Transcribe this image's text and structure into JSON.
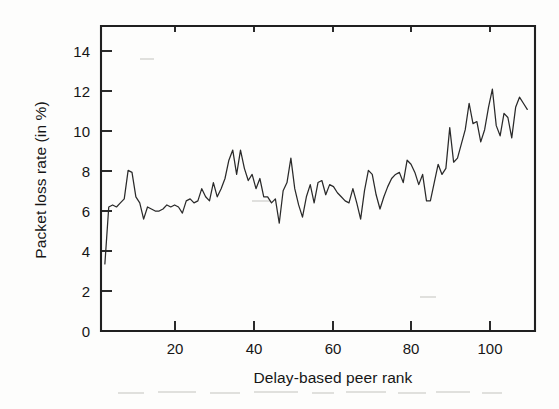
{
  "figure": {
    "background_color": "#fdfdfc",
    "ink_color": "#202020",
    "line_color": "#2a2a2a"
  },
  "chart_data": {
    "type": "line",
    "title": "",
    "xlabel": "Delay-based peer rank",
    "ylabel": "Packet loss rate (in %)",
    "xlim": [
      0,
      112
    ],
    "ylim": [
      0,
      15
    ],
    "xticks": [
      20,
      40,
      60,
      80,
      100
    ],
    "yticks": [
      0,
      2,
      4,
      6,
      8,
      10,
      12,
      14
    ],
    "grid": false,
    "legend": null,
    "series": [
      {
        "name": "Packet loss rate",
        "x": [
          1,
          2,
          3,
          4,
          5,
          6,
          7,
          8,
          9,
          10,
          11,
          12,
          13,
          14,
          15,
          16,
          17,
          18,
          19,
          20,
          21,
          22,
          23,
          24,
          25,
          26,
          27,
          28,
          29,
          30,
          31,
          32,
          33,
          34,
          35,
          36,
          37,
          38,
          39,
          40,
          41,
          42,
          43,
          44,
          45,
          46,
          47,
          48,
          49,
          50,
          51,
          52,
          53,
          54,
          55,
          56,
          57,
          58,
          59,
          60,
          61,
          62,
          63,
          64,
          65,
          66,
          67,
          68,
          69,
          70,
          71,
          72,
          73,
          74,
          75,
          76,
          77,
          78,
          79,
          80,
          81,
          82,
          83,
          84,
          85,
          86,
          87,
          88,
          89,
          90,
          91,
          92,
          93,
          94,
          95,
          96,
          97,
          98,
          99,
          100,
          101,
          102,
          103,
          104,
          105,
          106,
          107,
          108,
          109,
          110
        ],
        "values": [
          3.3,
          6.1,
          6.2,
          6.1,
          6.3,
          6.5,
          7.9,
          7.8,
          6.6,
          6.3,
          5.5,
          6.1,
          6.0,
          5.9,
          5.9,
          6.0,
          6.2,
          6.1,
          6.2,
          6.1,
          5.8,
          6.4,
          6.5,
          6.3,
          6.4,
          7.0,
          6.6,
          6.4,
          7.3,
          6.6,
          7.0,
          7.5,
          8.4,
          8.9,
          7.7,
          8.9,
          8.0,
          7.4,
          7.7,
          7.0,
          7.5,
          6.6,
          6.6,
          6.3,
          6.5,
          5.3,
          6.9,
          7.3,
          8.5,
          7.0,
          6.2,
          5.6,
          6.6,
          7.2,
          6.3,
          7.3,
          7.4,
          6.7,
          7.2,
          7.1,
          6.8,
          6.6,
          6.4,
          6.3,
          7.0,
          6.3,
          5.5,
          6.9,
          7.9,
          7.7,
          6.7,
          6.0,
          6.6,
          7.1,
          7.5,
          7.7,
          7.8,
          7.3,
          8.4,
          8.2,
          7.8,
          7.2,
          7.7,
          7.4,
          9.2,
          8.5,
          7.6,
          7.1,
          7.2,
          8.3,
          7.7,
          7.9,
          8.4,
          8.2,
          7.3,
          7.3,
          8.7,
          7.8,
          7.2,
          6.1,
          6.5,
          7.2,
          6.6,
          7.0,
          7.4,
          7.7,
          7.4,
          6.9,
          7.7,
          6.6
        ]
      }
    ],
    "series_tail": {
      "note": "rising tail region of the same single series",
      "x": [
        84,
        85,
        86,
        87,
        88,
        89,
        90,
        91,
        92,
        93,
        94,
        95,
        96,
        97,
        98,
        99,
        100,
        101,
        102,
        103,
        104,
        105,
        106,
        107,
        108,
        109,
        110
      ],
      "values": [
        6.4,
        6.4,
        7.3,
        8.2,
        7.7,
        8.0,
        10.0,
        8.3,
        8.5,
        9.2,
        9.9,
        11.2,
        10.2,
        10.3,
        9.3,
        9.9,
        11.0,
        11.9,
        10.1,
        9.6,
        10.7,
        10.5,
        9.5,
        11.0,
        11.5,
        11.2,
        10.9
      ]
    },
    "observations": {
      "min_value": 3.3,
      "max_value": 11.9,
      "trend": "increasing with high variance; flat 6-8% band for ranks 1-85, rising to 9-12% for ranks 86-110"
    }
  },
  "axes": {
    "y_tick_labels": [
      "14",
      "12",
      "10",
      "8",
      "6",
      "4",
      "2",
      "0"
    ],
    "x_tick_labels": [
      "20",
      "40",
      "60",
      "80",
      "100"
    ],
    "y_axis_title": "Packet loss rate (in %)",
    "x_axis_title": "Delay-based peer rank"
  }
}
